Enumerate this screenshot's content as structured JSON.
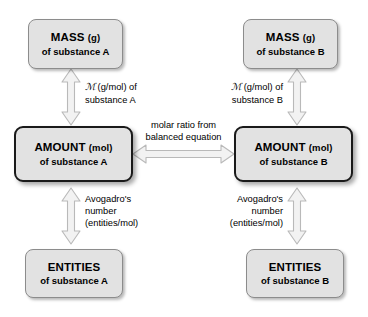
{
  "diagram": {
    "colors": {
      "box_fill": "#e2e2e2",
      "box_border": "#8c8c8c",
      "box_border_emphasis": "#1a1a1a",
      "arrow_fill": "#f2f2f2",
      "arrow_stroke": "#b5b5b5",
      "text": "#000000",
      "background": "#ffffff"
    }
  },
  "nodes": {
    "mass_a": {
      "title": "MASS",
      "unit": "(g)",
      "sub": "of substance A"
    },
    "mass_b": {
      "title": "MASS",
      "unit": "(g)",
      "sub": "of substance B"
    },
    "amount_a": {
      "title": "AMOUNT",
      "unit": "(mol)",
      "sub": "of substance A"
    },
    "amount_b": {
      "title": "AMOUNT",
      "unit": "(mol)",
      "sub": "of substance B"
    },
    "entities_a": {
      "title": "ENTITIES",
      "unit": "",
      "sub": "of substance A"
    },
    "entities_b": {
      "title": "ENTITIES",
      "unit": "",
      "sub": "of substance B"
    }
  },
  "edges": {
    "mass_amount_a": {
      "symbol": "ℳ",
      "line1_rest": " (g/mol) of",
      "line2": "substance A"
    },
    "mass_amount_b": {
      "symbol": "ℳ",
      "line1_rest": " (g/mol) of",
      "line2": "substance B"
    },
    "amount_entities_a": {
      "line1": "Avogadro's",
      "line2": "number",
      "line3": "(entities/mol)"
    },
    "amount_entities_b": {
      "line1": "Avogadro's",
      "line2": "number",
      "line3": "(entities/mol)"
    },
    "amount_amount": {
      "line1": "molar ratio from",
      "line2": "balanced equation"
    }
  }
}
